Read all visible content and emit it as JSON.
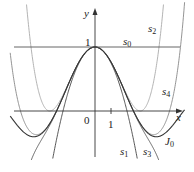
{
  "figure": {
    "axes": {
      "x_label": "x",
      "y_label": "y",
      "origin_label": "0",
      "x_tick_label": "1",
      "y_tick_label": "1"
    },
    "curve_labels": {
      "s0": {
        "base": "s",
        "sub": "0"
      },
      "s1": {
        "base": "s",
        "sub": "1"
      },
      "s2": {
        "base": "s",
        "sub": "2"
      },
      "s3": {
        "base": "s",
        "sub": "3"
      },
      "s4": {
        "base": "s",
        "sub": "4"
      },
      "J0": {
        "base": "J",
        "sub": "0"
      }
    },
    "colors": {
      "axis": "#333333",
      "J0": "#333333",
      "s0": "#555555",
      "s1": "#444444",
      "s2": "#aaaaaa",
      "s3": "#555555",
      "s4": "#888888"
    },
    "mapping": {
      "origin_px": [
        95,
        111
      ],
      "unit_x_px": 16,
      "unit_y_px": 64,
      "x_range": [
        -5.3,
        5.6
      ],
      "y_range": [
        -0.95,
        1.6
      ]
    },
    "curves": [
      {
        "name": "s0",
        "formula": "1"
      },
      {
        "name": "s1",
        "formula": "1 - x^2/4"
      },
      {
        "name": "s2",
        "formula": "1 - x^2/4 + x^4/64"
      },
      {
        "name": "s3",
        "formula": "1 - x^2/4 + x^4/64 - x^6/2304"
      },
      {
        "name": "s4",
        "formula": "1 - x^2/4 + x^4/64 - x^6/2304 + x^8/147456"
      },
      {
        "name": "J0",
        "formula": "sum (-1)^n x^(2n) / (2^(2n) (n!)^2)"
      }
    ]
  }
}
